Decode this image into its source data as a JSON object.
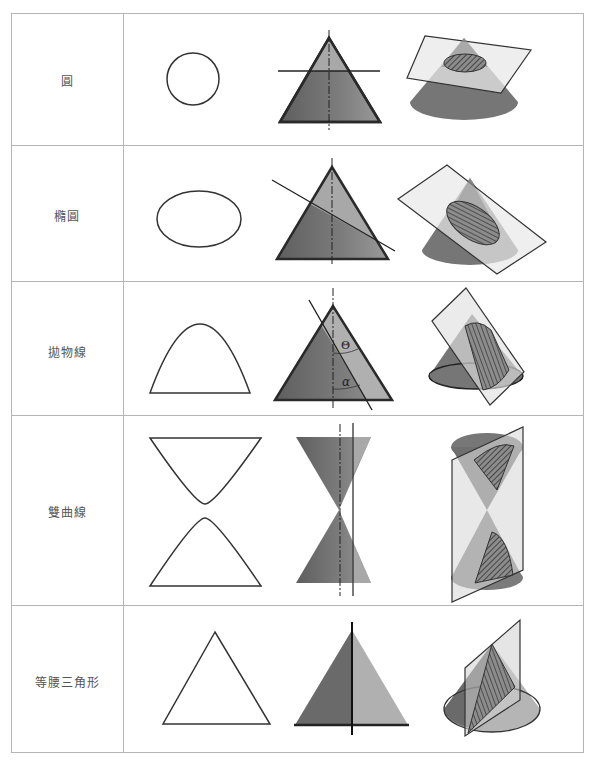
{
  "colors": {
    "border": "#b5b5b5",
    "outline": "#333333",
    "cone_dark": "#6f6f6f",
    "cone_mid": "#8a8a8a",
    "cone_light": "#b3b3b3",
    "plane_fill": "#e6e6e6",
    "section_fill": "#555555"
  },
  "rows": [
    {
      "key": "circle",
      "label": "圓",
      "curve": "circle",
      "section": "horizontal plane"
    },
    {
      "key": "ellipse",
      "label": "橢圓",
      "curve": "ellipse",
      "section": "oblique plane"
    },
    {
      "key": "parabola",
      "label": "拋物線",
      "curve": "parabola",
      "section": "plane parallel to generator",
      "angle_labels": [
        "Θ",
        "α"
      ]
    },
    {
      "key": "hyperbola",
      "label": "雙曲線",
      "curve": "hyperbola",
      "section": "vertical plane off axis"
    },
    {
      "key": "isosceles",
      "label": "等腰三角形",
      "curve": "isosceles triangle",
      "section": "vertical plane through axis"
    }
  ]
}
